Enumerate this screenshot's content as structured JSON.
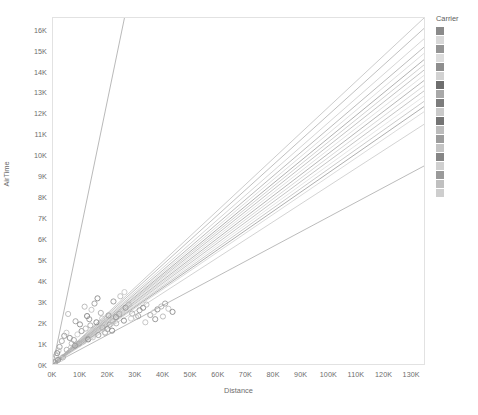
{
  "chart_data": {
    "type": "scatter",
    "title": "",
    "xlabel": "Distance",
    "ylabel": "AirTime",
    "xlim": [
      0,
      135000
    ],
    "ylim": [
      0,
      16600
    ],
    "grid": false,
    "x_ticks": [
      "0K",
      "10K",
      "20K",
      "30K",
      "40K",
      "50K",
      "60K",
      "70K",
      "80K",
      "90K",
      "100K",
      "110K",
      "120K",
      "130K"
    ],
    "x_tick_values": [
      0,
      10000,
      20000,
      30000,
      40000,
      50000,
      60000,
      70000,
      80000,
      90000,
      100000,
      110000,
      120000,
      130000
    ],
    "y_ticks": [
      "0K",
      "1K",
      "2K",
      "3K",
      "4K",
      "5K",
      "6K",
      "7K",
      "8K",
      "9K",
      "10K",
      "11K",
      "12K",
      "13K",
      "14K",
      "15K",
      "16K"
    ],
    "y_tick_values": [
      0,
      1000,
      2000,
      3000,
      4000,
      5000,
      6000,
      7000,
      8000,
      9000,
      10000,
      11000,
      12000,
      13000,
      14000,
      15000,
      16000
    ],
    "legend": {
      "title": "Carrier",
      "position": "right",
      "entries": [
        {
          "label": "",
          "color": "#8a8a8a"
        },
        {
          "label": "",
          "color": "#d8d8d8"
        },
        {
          "label": "",
          "color": "#949494"
        },
        {
          "label": "",
          "color": "#dcdcdc"
        },
        {
          "label": "",
          "color": "#8e8e8e"
        },
        {
          "label": "",
          "color": "#d2d2d2"
        },
        {
          "label": "",
          "color": "#6e6e6e"
        },
        {
          "label": "",
          "color": "#a8a8a8"
        },
        {
          "label": "",
          "color": "#7c7c7c"
        },
        {
          "label": "",
          "color": "#cacaca"
        },
        {
          "label": "",
          "color": "#747474"
        },
        {
          "label": "",
          "color": "#bcbcbc"
        },
        {
          "label": "",
          "color": "#9c9c9c"
        },
        {
          "label": "",
          "color": "#c4c4c4"
        },
        {
          "label": "",
          "color": "#868686"
        },
        {
          "label": "",
          "color": "#d0d0d0"
        },
        {
          "label": "",
          "color": "#9a9a9a"
        },
        {
          "label": "",
          "color": "#c0c0c0"
        },
        {
          "label": "",
          "color": "#cecece"
        }
      ]
    },
    "trend_lines": [
      {
        "name": "carrier-01",
        "color": "#9a9a9a",
        "width": 0.7,
        "x0": 0,
        "y0": 0,
        "x1": 26000,
        "y1": 16600
      },
      {
        "name": "carrier-02",
        "color": "#b6b6b6",
        "width": 0.7,
        "x0": 0,
        "y0": 0,
        "x1": 135000,
        "y1": 16600
      },
      {
        "name": "carrier-03",
        "color": "#a4a4a4",
        "width": 0.7,
        "x0": 0,
        "y0": 0,
        "x1": 135000,
        "y1": 16100
      },
      {
        "name": "carrier-04",
        "color": "#c2c2c2",
        "width": 0.7,
        "x0": 0,
        "y0": 0,
        "x1": 135000,
        "y1": 15600
      },
      {
        "name": "carrier-05",
        "color": "#9e9e9e",
        "width": 0.7,
        "x0": 0,
        "y0": 0,
        "x1": 135000,
        "y1": 15200
      },
      {
        "name": "carrier-06",
        "color": "#cfcfcf",
        "width": 0.7,
        "x0": 0,
        "y0": 0,
        "x1": 135000,
        "y1": 14900
      },
      {
        "name": "carrier-07",
        "color": "#8e8e8e",
        "width": 0.7,
        "x0": 0,
        "y0": 0,
        "x1": 135000,
        "y1": 14600
      },
      {
        "name": "carrier-08",
        "color": "#bdbdbd",
        "width": 0.7,
        "x0": 0,
        "y0": 0,
        "x1": 135000,
        "y1": 14350
      },
      {
        "name": "carrier-09",
        "color": "#a9a9a9",
        "width": 0.7,
        "x0": 0,
        "y0": 0,
        "x1": 135000,
        "y1": 14100
      },
      {
        "name": "carrier-10",
        "color": "#d4d4d4",
        "width": 0.7,
        "x0": 0,
        "y0": 0,
        "x1": 135000,
        "y1": 13850
      },
      {
        "name": "carrier-11",
        "color": "#979797",
        "width": 0.7,
        "x0": 0,
        "y0": 0,
        "x1": 135000,
        "y1": 13600
      },
      {
        "name": "carrier-12",
        "color": "#c7c7c7",
        "width": 0.7,
        "x0": 0,
        "y0": 0,
        "x1": 135000,
        "y1": 13350
      },
      {
        "name": "carrier-13",
        "color": "#ababab",
        "width": 0.7,
        "x0": 0,
        "y0": 0,
        "x1": 135000,
        "y1": 13100
      },
      {
        "name": "carrier-14",
        "color": "#d9d9d9",
        "width": 0.7,
        "x0": 0,
        "y0": 0,
        "x1": 135000,
        "y1": 12850
      },
      {
        "name": "carrier-15",
        "color": "#b2b2b2",
        "width": 0.7,
        "x0": 0,
        "y0": 0,
        "x1": 135000,
        "y1": 12600
      },
      {
        "name": "carrier-16",
        "color": "#8a8a8a",
        "width": 0.7,
        "x0": 0,
        "y0": 0,
        "x1": 135000,
        "y1": 12350
      },
      {
        "name": "carrier-17",
        "color": "#cbcbcb",
        "width": 0.7,
        "x0": 0,
        "y0": 0,
        "x1": 135000,
        "y1": 12100
      },
      {
        "name": "carrier-18",
        "color": "#bfbfbf",
        "width": 0.7,
        "x0": 0,
        "y0": 0,
        "x1": 135000,
        "y1": 11500
      },
      {
        "name": "carrier-19",
        "color": "#9d9d9d",
        "width": 0.7,
        "x0": 0,
        "y0": 0,
        "x1": 135000,
        "y1": 9500
      }
    ],
    "points": [
      {
        "x": 5500,
        "y": 2400,
        "color": "#b9b9b9"
      },
      {
        "x": 8200,
        "y": 2050,
        "color": "#a0a0a0"
      },
      {
        "x": 9800,
        "y": 1900,
        "color": "#8d8d8d"
      },
      {
        "x": 11500,
        "y": 2750,
        "color": "#b5b5b5"
      },
      {
        "x": 12400,
        "y": 2300,
        "color": "#7f7f7f"
      },
      {
        "x": 13200,
        "y": 2150,
        "color": "#989898"
      },
      {
        "x": 14000,
        "y": 2600,
        "color": "#c2c2c2"
      },
      {
        "x": 15100,
        "y": 2900,
        "color": "#9b9b9b"
      },
      {
        "x": 16200,
        "y": 3150,
        "color": "#888888"
      },
      {
        "x": 17400,
        "y": 2450,
        "color": "#ababab"
      },
      {
        "x": 18000,
        "y": 1750,
        "color": "#b0b0b0"
      },
      {
        "x": 18900,
        "y": 1520,
        "color": "#c8c8c8"
      },
      {
        "x": 19800,
        "y": 1680,
        "color": "#8f8f8f"
      },
      {
        "x": 20600,
        "y": 1880,
        "color": "#a6a6a6"
      },
      {
        "x": 21800,
        "y": 2050,
        "color": "#bdbdbd"
      },
      {
        "x": 22900,
        "y": 2250,
        "color": "#959595"
      },
      {
        "x": 24100,
        "y": 2400,
        "color": "#a2a2a2"
      },
      {
        "x": 25300,
        "y": 2550,
        "color": "#cbcbcb"
      },
      {
        "x": 26400,
        "y": 2700,
        "color": "#909090"
      },
      {
        "x": 27600,
        "y": 2850,
        "color": "#b7b7b7"
      },
      {
        "x": 28800,
        "y": 2420,
        "color": "#a9a9a9"
      },
      {
        "x": 30200,
        "y": 2250,
        "color": "#c4c4c4"
      },
      {
        "x": 31500,
        "y": 2580,
        "color": "#999999"
      },
      {
        "x": 32800,
        "y": 2700,
        "color": "#858585"
      },
      {
        "x": 34000,
        "y": 2850,
        "color": "#bababa"
      },
      {
        "x": 35400,
        "y": 2350,
        "color": "#a4a4a4"
      },
      {
        "x": 36700,
        "y": 2480,
        "color": "#cdcdcd"
      },
      {
        "x": 38000,
        "y": 2620,
        "color": "#929292"
      },
      {
        "x": 39400,
        "y": 2760,
        "color": "#b3b3b3"
      },
      {
        "x": 40800,
        "y": 2900,
        "color": "#9e9e9e"
      },
      {
        "x": 42000,
        "y": 2650,
        "color": "#c0c0c0"
      },
      {
        "x": 43500,
        "y": 2500,
        "color": "#8b8b8b"
      },
      {
        "x": 3200,
        "y": 1100,
        "color": "#a7a7a7"
      },
      {
        "x": 4100,
        "y": 1350,
        "color": "#939393"
      },
      {
        "x": 4900,
        "y": 1500,
        "color": "#c6c6c6"
      },
      {
        "x": 6100,
        "y": 1250,
        "color": "#8c8c8c"
      },
      {
        "x": 6800,
        "y": 980,
        "color": "#b8b8b8"
      },
      {
        "x": 7600,
        "y": 1150,
        "color": "#a1a1a1"
      },
      {
        "x": 2400,
        "y": 820,
        "color": "#9f9f9f"
      },
      {
        "x": 2000,
        "y": 640,
        "color": "#bcbcbc"
      },
      {
        "x": 1500,
        "y": 520,
        "color": "#878787"
      },
      {
        "x": 1100,
        "y": 400,
        "color": "#aeaeae"
      },
      {
        "x": 8900,
        "y": 1420,
        "color": "#cacaca"
      },
      {
        "x": 10400,
        "y": 1580,
        "color": "#969696"
      },
      {
        "x": 11900,
        "y": 1700,
        "color": "#b4b4b4"
      },
      {
        "x": 13600,
        "y": 1850,
        "color": "#a5a5a5"
      },
      {
        "x": 15800,
        "y": 2000,
        "color": "#828282"
      },
      {
        "x": 17900,
        "y": 2180,
        "color": "#c1c1c1"
      },
      {
        "x": 20200,
        "y": 2330,
        "color": "#9c9c9c"
      },
      {
        "x": 23000,
        "y": 1950,
        "color": "#b1b1b1"
      },
      {
        "x": 25800,
        "y": 2080,
        "color": "#8a8a8a"
      },
      {
        "x": 28400,
        "y": 2180,
        "color": "#c9c9c9"
      },
      {
        "x": 31000,
        "y": 2300,
        "color": "#a3a3a3"
      },
      {
        "x": 33600,
        "y": 2000,
        "color": "#bfbfbf"
      },
      {
        "x": 37200,
        "y": 2150,
        "color": "#919191"
      },
      {
        "x": 40000,
        "y": 2280,
        "color": "#b6b6b6"
      },
      {
        "x": 5000,
        "y": 680,
        "color": "#adadad"
      },
      {
        "x": 6500,
        "y": 780,
        "color": "#c5c5c5"
      },
      {
        "x": 8000,
        "y": 880,
        "color": "#949494"
      },
      {
        "x": 9500,
        "y": 980,
        "color": "#a8a8a8"
      },
      {
        "x": 11000,
        "y": 1080,
        "color": "#bebebe"
      },
      {
        "x": 12800,
        "y": 1180,
        "color": "#898989"
      },
      {
        "x": 14500,
        "y": 1280,
        "color": "#c3c3c3"
      },
      {
        "x": 16500,
        "y": 1390,
        "color": "#9d9d9d"
      },
      {
        "x": 19000,
        "y": 1490,
        "color": "#b2b2b2"
      },
      {
        "x": 21500,
        "y": 1600,
        "color": "#868686"
      },
      {
        "x": 3600,
        "y": 320,
        "color": "#aaaaaa"
      },
      {
        "x": 2800,
        "y": 250,
        "color": "#cccccc"
      },
      {
        "x": 1800,
        "y": 190,
        "color": "#909090"
      },
      {
        "x": 1200,
        "y": 140,
        "color": "#b0b0b0"
      },
      {
        "x": 700,
        "y": 90,
        "color": "#a0a0a0"
      },
      {
        "x": 26000,
        "y": 3450,
        "color": "#c7c7c7"
      },
      {
        "x": 22000,
        "y": 3000,
        "color": "#979797"
      },
      {
        "x": 24500,
        "y": 3250,
        "color": "#bbbbbb"
      }
    ]
  }
}
